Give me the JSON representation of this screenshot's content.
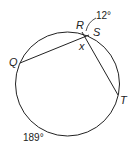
{
  "diagram": {
    "type": "circle-secants",
    "points": {
      "Q": "Q",
      "R": "R",
      "S": "S",
      "T": "T"
    },
    "intersection_label": "x",
    "arc_labels": {
      "RS": "12°",
      "QT": "189°"
    },
    "stroke_color": "#222222"
  }
}
